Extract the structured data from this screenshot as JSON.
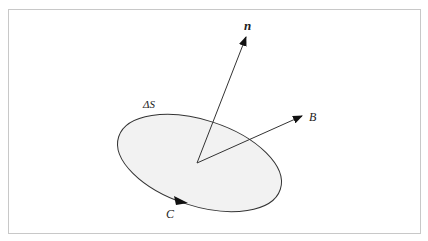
{
  "figure": {
    "labels": {
      "normal": "n",
      "field": "B",
      "surface": "ΔS",
      "contour": "C"
    },
    "colors": {
      "fill": "#f2f2f2",
      "stroke": "#222222",
      "border": "#c8c8c8"
    }
  }
}
